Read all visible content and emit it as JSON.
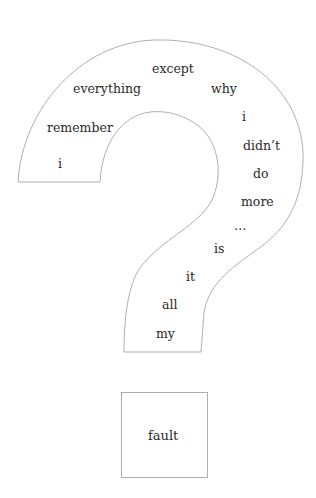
{
  "poem": {
    "words": [
      {
        "text": "except",
        "x": 152,
        "y": 63
      },
      {
        "text": "everything",
        "x": 73,
        "y": 83
      },
      {
        "text": "why",
        "x": 211,
        "y": 83
      },
      {
        "text": "remember",
        "x": 47,
        "y": 122
      },
      {
        "text": "i",
        "x": 242,
        "y": 111
      },
      {
        "text": "didn’t",
        "x": 243,
        "y": 140
      },
      {
        "text": "i",
        "x": 58,
        "y": 158
      },
      {
        "text": "do",
        "x": 253,
        "y": 168
      },
      {
        "text": "more",
        "x": 241,
        "y": 196
      },
      {
        "text": "…",
        "x": 234,
        "y": 220
      },
      {
        "text": "is",
        "x": 214,
        "y": 243
      },
      {
        "text": "it",
        "x": 186,
        "y": 271
      },
      {
        "text": "all",
        "x": 162,
        "y": 299
      },
      {
        "text": "my",
        "x": 156,
        "y": 328
      }
    ],
    "box_word": "fault"
  },
  "colors": {
    "outline": "#9a9a9a",
    "text": "#2a2a2a",
    "background": "#ffffff"
  }
}
